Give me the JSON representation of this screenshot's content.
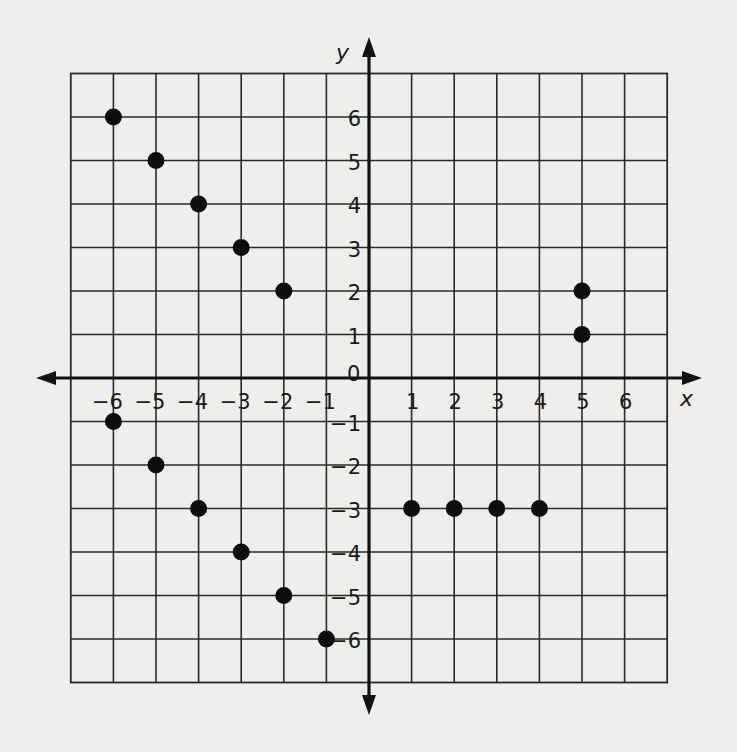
{
  "chart_data": {
    "type": "scatter",
    "title": "",
    "xlabel": "x",
    "ylabel": "y",
    "xlim": [
      -7,
      7
    ],
    "ylim": [
      -7,
      7
    ],
    "grid": true,
    "legend": null,
    "x_ticks": [
      -6,
      -5,
      -4,
      -3,
      -2,
      -1,
      1,
      2,
      3,
      4,
      5,
      6
    ],
    "y_ticks": [
      -6,
      -5,
      -4,
      -3,
      -2,
      -1,
      1,
      2,
      3,
      4,
      5,
      6
    ],
    "x_tick_labels": [
      "−6",
      "−5",
      "−4",
      "−3",
      "−2",
      "−1",
      "1",
      "2",
      "3",
      "4",
      "5",
      "6"
    ],
    "y_tick_labels": [
      "−6",
      "−5",
      "−4",
      "−3",
      "−2",
      "−1",
      "1",
      "2",
      "3",
      "4",
      "5",
      "6"
    ],
    "origin_label": "0",
    "series": [
      {
        "name": "points",
        "color": "#0c0c0c",
        "points": [
          [
            -6,
            6
          ],
          [
            -5,
            5
          ],
          [
            -4,
            4
          ],
          [
            -3,
            3
          ],
          [
            -2,
            2
          ],
          [
            -6,
            -1
          ],
          [
            -5,
            -2
          ],
          [
            -4,
            -3
          ],
          [
            -3,
            -4
          ],
          [
            -2,
            -5
          ],
          [
            -1,
            -6
          ],
          [
            1,
            -3
          ],
          [
            2,
            -3
          ],
          [
            3,
            -3
          ],
          [
            4,
            -3
          ],
          [
            5,
            2
          ],
          [
            5,
            1
          ]
        ]
      }
    ]
  },
  "layout": {
    "origin_px": [
      369,
      378
    ],
    "unit_x_px": 42.6,
    "unit_y_px": 43.5
  },
  "colors": {
    "background": "#eeeeec",
    "grid": "#2a2a2a",
    "axis": "#111111",
    "point": "#0c0c0c"
  }
}
